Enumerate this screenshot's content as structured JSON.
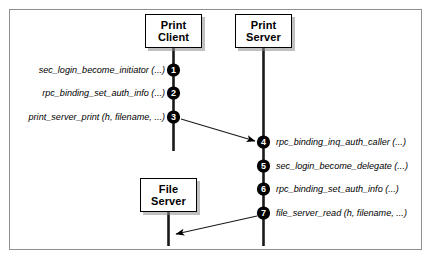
{
  "figure": {
    "type": "sequence-diagram",
    "title": "",
    "border_color": "#8f8f8f",
    "background": "#ffffff",
    "marker_fill": "#000000",
    "marker_text_color": "#ffffff"
  },
  "participants": [
    {
      "id": "print-client",
      "line1": "Print",
      "line2": "Client"
    },
    {
      "id": "print-server",
      "line1": "Print",
      "line2": "Server"
    },
    {
      "id": "file-server",
      "line1": "File",
      "line2": "Server"
    }
  ],
  "steps": [
    {
      "number": "1",
      "label": "sec_login_become_initiator (...)",
      "side": "left",
      "lifeline": "print-client"
    },
    {
      "number": "2",
      "label": "rpc_binding_set_auth_info (...)",
      "side": "left",
      "lifeline": "print-client"
    },
    {
      "number": "3",
      "label": "print_server_print (h, filename, ...)",
      "side": "left",
      "lifeline": "print-client"
    },
    {
      "number": "4",
      "label": "rpc_binding_inq_auth_caller (...)",
      "side": "right",
      "lifeline": "print-server"
    },
    {
      "number": "5",
      "label": "sec_login_become_delegate (...)",
      "side": "right",
      "lifeline": "print-server"
    },
    {
      "number": "6",
      "label": "rpc_binding_set_auth_info (...)",
      "side": "right",
      "lifeline": "print-server"
    },
    {
      "number": "7",
      "label": "file_server_read (h, filename, ...)",
      "side": "right",
      "lifeline": "print-server"
    }
  ],
  "messages": [
    {
      "id": "msg-3-to-4",
      "from_step": "3",
      "to_step": "4",
      "direction": "client-to-server"
    },
    {
      "id": "msg-7-to-file",
      "from_step": "7",
      "to_target": "file-server",
      "direction": "server-to-file"
    }
  ]
}
